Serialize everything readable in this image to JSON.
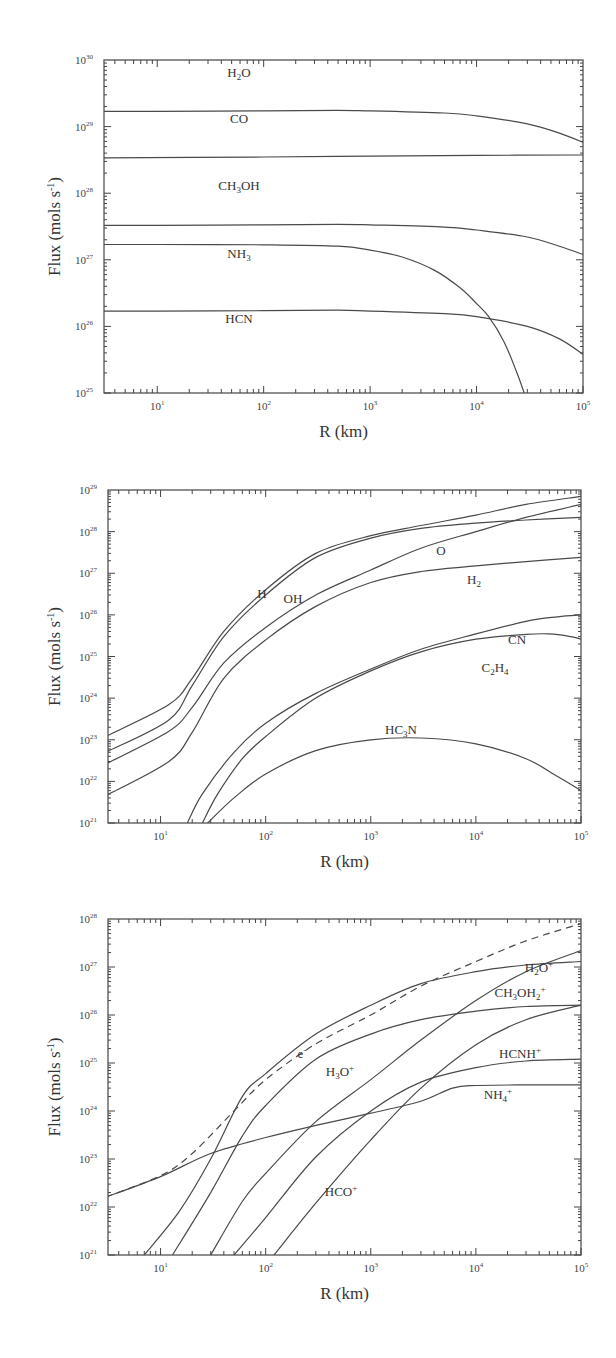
{
  "chart_data": [
    {
      "type": "line",
      "title": "",
      "xlabel": "R (km)",
      "ylabel": "Flux (mols s⁻¹)",
      "xscale": "log",
      "yscale": "log",
      "xlim": [
        3,
        100000
      ],
      "ylim": [
        1e+25,
        1e+30
      ],
      "x_ticks": [
        "10^1",
        "10^2",
        "10^3",
        "10^4",
        "10^5"
      ],
      "y_ticks": [
        "10^25",
        "10^26",
        "10^27",
        "10^28",
        "10^29",
        "10^30"
      ],
      "frame": {
        "left": 104,
        "right": 583,
        "top": 60,
        "bottom": 393,
        "xlog_min": 0.5,
        "xlog_max": 5,
        "ylog_min": 25,
        "ylog_max": 30
      },
      "series": [
        {
          "name": "H2O",
          "label": "H₂O",
          "label_pos": [
            239,
            77
          ],
          "x": [
            3,
            10,
            100,
            500,
            1000,
            5000,
            10000,
            30000,
            60000,
            100000
          ],
          "y": [
            1.7e+29,
            1.7e+29,
            1.72e+29,
            1.75e+29,
            1.72e+29,
            1.6e+29,
            1.45e+29,
            1.1e+29,
            8e+28,
            5.8e+28
          ]
        },
        {
          "name": "CO",
          "label": "CO",
          "label_pos": [
            239,
            123
          ],
          "x": [
            3,
            100,
            1000,
            10000,
            100000
          ],
          "y": [
            3.4e+28,
            3.5e+28,
            3.6e+28,
            3.7e+28,
            3.75e+28
          ]
        },
        {
          "name": "CH3OH",
          "label": "CH₃OH",
          "label_pos": [
            239,
            190
          ],
          "x": [
            3,
            10,
            100,
            500,
            1000,
            5000,
            10000,
            30000,
            60000,
            100000
          ],
          "y": [
            3.3e+27,
            3.3e+27,
            3.35e+27,
            3.4e+27,
            3.35e+27,
            3.1e+27,
            2.8e+27,
            2.2e+27,
            1.6e+27,
            1.2e+27
          ]
        },
        {
          "name": "NH3",
          "label": "NH₃",
          "label_pos": [
            239,
            258
          ],
          "x": [
            3,
            10,
            100,
            500,
            1000,
            2000,
            4000,
            7000,
            10000,
            13000,
            18000,
            24000,
            28000
          ],
          "y": [
            1.7e+27,
            1.7e+27,
            1.68e+27,
            1.6e+27,
            1.4e+27,
            1.1e+27,
            7e+26,
            3.8e+26,
            2.2e+26,
            1.4e+26,
            6e+25,
            2e+25,
            1e+25
          ]
        },
        {
          "name": "HCN",
          "label": "HCN",
          "label_pos": [
            239,
            323
          ],
          "x": [
            3,
            10,
            100,
            500,
            1000,
            5000,
            10000,
            30000,
            60000,
            100000
          ],
          "y": [
            1.7e+26,
            1.7e+26,
            1.72e+26,
            1.75e+26,
            1.7e+26,
            1.55e+26,
            1.4e+26,
            1e+26,
            6.5e+25,
            3.8e+25
          ]
        }
      ]
    },
    {
      "type": "line",
      "title": "",
      "xlabel": "R (km)",
      "ylabel": "Flux (mols s⁻¹)",
      "xscale": "log",
      "yscale": "log",
      "xlim": [
        3,
        100000
      ],
      "ylim": [
        1e+21,
        1e+29
      ],
      "x_ticks": [
        "10^1",
        "10^2",
        "10^3",
        "10^4",
        "10^5"
      ],
      "y_ticks": [
        "10^21",
        "10^22",
        "10^23",
        "10^24",
        "10^25",
        "10^26",
        "10^27",
        "10^28",
        "10^29"
      ],
      "frame": {
        "left": 108,
        "right": 581,
        "top": 490,
        "bottom": 823,
        "xlog_min": 0.5,
        "xlog_max": 5,
        "ylog_min": 21,
        "ylog_max": 29
      },
      "series": [
        {
          "name": "H",
          "label": "H",
          "label_pos": [
            262,
            598
          ],
          "x": [
            3,
            12,
            20,
            40,
            100,
            300,
            1000,
            3000,
            10000,
            30000,
            100000
          ],
          "y": [
            1.2e+23,
            7e+23,
            3e+24,
            4e+25,
            4e+26,
            3e+27,
            8e+27,
            1.4e+28,
            2.5e+28,
            4.5e+28,
            7e+28
          ]
        },
        {
          "name": "OH",
          "label": "OH",
          "label_pos": [
            293,
            603
          ],
          "x": [
            3,
            12,
            20,
            40,
            100,
            300,
            1000,
            3000,
            10000,
            30000,
            100000
          ],
          "y": [
            5e+22,
            3e+23,
            2e+24,
            3e+25,
            3e+26,
            2.4e+27,
            7e+27,
            1.2e+28,
            1.6e+28,
            1.9e+28,
            2.2e+28
          ]
        },
        {
          "name": "O",
          "label": "O",
          "label_pos": [
            441,
            555
          ],
          "x": [
            3,
            12,
            20,
            40,
            100,
            300,
            1000,
            3000,
            10000,
            30000,
            100000
          ],
          "y": [
            2.6e+22,
            1.6e+23,
            6e+23,
            7e+24,
            5e+25,
            3e+26,
            1.2e+27,
            4e+27,
            1e+28,
            2.2e+28,
            4.5e+28
          ]
        },
        {
          "name": "H2",
          "label": "H₂",
          "label_pos": [
            474,
            584
          ],
          "x": [
            3,
            12,
            20,
            40,
            100,
            300,
            1000,
            3000,
            10000,
            30000,
            100000
          ],
          "y": [
            4.5e+21,
            3e+22,
            1.5e+23,
            3e+24,
            2.5e+25,
            1.6e+26,
            6e+26,
            1.1e+27,
            1.5e+27,
            1.9e+27,
            2.4e+27
          ]
        },
        {
          "name": "CN",
          "label": "CN",
          "label_pos": [
            517,
            644
          ],
          "x": [
            18,
            25,
            50,
            100,
            300,
            1000,
            3000,
            10000,
            30000,
            60000,
            100000
          ],
          "y": [
            1e+21,
            5e+21,
            5e+22,
            2.5e+23,
            1.3e+24,
            5e+24,
            1.5e+25,
            3.5e+25,
            7e+25,
            9e+25,
            1e+26
          ]
        },
        {
          "name": "C2H4",
          "label": "C₂H₄",
          "label_pos": [
            495,
            672
          ],
          "x": [
            25,
            35,
            60,
            100,
            300,
            1000,
            3000,
            10000,
            30000,
            50000,
            80000,
            100000
          ],
          "y": [
            1e+21,
            5e+21,
            3.5e+22,
            1.2e+23,
            1e+24,
            4.5e+24,
            1.3e+25,
            2.6e+25,
            3.4e+25,
            3.5e+25,
            3e+25,
            2.6e+25
          ]
        },
        {
          "name": "HC3N",
          "label": "HC₃N",
          "label_pos": [
            401,
            734
          ],
          "x": [
            28,
            50,
            100,
            300,
            1000,
            3000,
            10000,
            30000,
            60000,
            100000
          ],
          "y": [
            1e+21,
            4e+21,
            1.5e+22,
            5.5e+22,
            1e+23,
            1.1e+23,
            8e+22,
            3.5e+22,
            1.3e+22,
            6e+21
          ]
        }
      ]
    },
    {
      "type": "line",
      "title": "",
      "xlabel": "R (km)",
      "ylabel": "Flux (mols s⁻¹)",
      "xscale": "log",
      "yscale": "log",
      "xlim": [
        3,
        100000
      ],
      "ylim": [
        1e+21,
        1e+28
      ],
      "x_ticks": [
        "10^1",
        "10^2",
        "10^3",
        "10^4",
        "10^5"
      ],
      "y_ticks": [
        "10^21",
        "10^22",
        "10^23",
        "10^24",
        "10^25",
        "10^26",
        "10^27",
        "10^28"
      ],
      "frame": {
        "left": 108,
        "right": 581,
        "top": 919,
        "bottom": 1255,
        "xlog_min": 0.5,
        "xlog_max": 5,
        "ylog_min": 21,
        "ylog_max": 28
      },
      "series": [
        {
          "name": "e-",
          "label": "e⁻",
          "label_pos": [
            302,
            1058
          ],
          "dashed": true,
          "x": [
            3,
            10,
            20,
            50,
            100,
            300,
            1000,
            3000,
            10000,
            30000,
            100000
          ],
          "y": [
            1.6e+22,
            4.5e+22,
            1.3e+23,
            1e+24,
            4.5e+24,
            2.5e+25,
            1e+26,
            4e+26,
            1.3e+27,
            3.5e+27,
            8e+27
          ]
        },
        {
          "name": "NH4+",
          "label": "NH₄⁺",
          "label_pos": [
            498,
            1099
          ],
          "x": [
            3,
            10,
            30,
            100,
            300,
            1000,
            3000,
            6000,
            10000,
            30000,
            100000
          ],
          "y": [
            1.6e+22,
            4.3e+22,
            1.3e+23,
            2.8e+23,
            5e+23,
            9e+23,
            1.6e+24,
            3e+24,
            3.4e+24,
            3.5e+24,
            3.5e+24
          ]
        },
        {
          "name": "H3O+",
          "label": "H₃O⁺",
          "label_pos": [
            340,
            1076
          ],
          "x": [
            7,
            15,
            30,
            60,
            100,
            300,
            1000,
            3000,
            10000,
            30000,
            100000
          ],
          "y": [
            1e+21,
            8e+21,
            1e+23,
            2e+24,
            6e+24,
            4e+25,
            1.6e+26,
            4.5e+26,
            8e+26,
            1.1e+27,
            1.3e+27
          ]
        },
        {
          "name": "CH3OH2+",
          "label": "CH₃OH₂⁺",
          "label_pos": [
            520,
            997
          ],
          "x": [
            13,
            30,
            60,
            100,
            300,
            1000,
            3000,
            10000,
            30000,
            100000
          ],
          "y": [
            1e+21,
            2e+22,
            3e+23,
            1.3e+24,
            1.2e+25,
            4e+25,
            8e+25,
            1.2e+26,
            1.5e+26,
            1.6e+26
          ]
        },
        {
          "name": "H2O+",
          "label": "H₂O⁺",
          "label_pos": [
            539,
            972
          ],
          "x": [
            30,
            60,
            100,
            300,
            1000,
            3000,
            10000,
            30000,
            100000
          ],
          "y": [
            1e+21,
            1.3e+22,
            5e+22,
            6e+23,
            4.5e+24,
            3e+25,
            2e+26,
            8e+26,
            2.2e+27
          ]
        },
        {
          "name": "HCNH+",
          "label": "HCNH⁺",
          "label_pos": [
            520,
            1058
          ],
          "x": [
            50,
            100,
            300,
            1000,
            3000,
            10000,
            30000,
            100000
          ],
          "y": [
            1e+21,
            6e+21,
            1.1e+23,
            1e+24,
            4e+24,
            8e+24,
            1.1e+25,
            1.2e+25
          ]
        },
        {
          "name": "HCO+",
          "label": "HCO⁺",
          "label_pos": [
            341,
            1196
          ],
          "x": [
            120,
            300,
            1000,
            3000,
            10000,
            30000,
            100000
          ],
          "y": [
            1e+21,
            1.2e+22,
            2.5e+23,
            3e+24,
            2.4e+25,
            8e+25,
            1.6e+26
          ]
        }
      ]
    }
  ]
}
